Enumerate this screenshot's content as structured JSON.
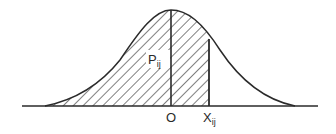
{
  "diagram": {
    "type": "normal-distribution-curve",
    "labels": {
      "peak_label_main": "P",
      "peak_label_sub": "ij",
      "origin_label": "O",
      "x_label_main": "X",
      "x_label_sub": "ij"
    },
    "shaded_region": "from left tail to X_ij (cumulative area)",
    "colors": {
      "stroke": "#2a2a2a",
      "background": "#ffffff"
    }
  }
}
